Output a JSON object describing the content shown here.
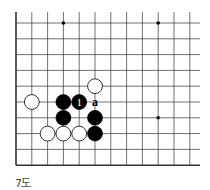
{
  "diagram": {
    "type": "go-board-fragment",
    "caption": "7도",
    "grid": {
      "origin_x": 16,
      "origin_y": 23,
      "spacing": 15.8,
      "cols": 12,
      "rows": 10,
      "left_edge": true,
      "bottom_edge": true
    },
    "star_points": [
      {
        "col": 3,
        "row": 0
      },
      {
        "col": 9,
        "row": 0
      },
      {
        "col": 9,
        "row": 6
      }
    ],
    "stones": [
      {
        "color": "white",
        "col": 5,
        "row": 4
      },
      {
        "color": "white",
        "col": 1,
        "row": 5
      },
      {
        "color": "black",
        "col": 3,
        "row": 5
      },
      {
        "color": "black",
        "col": 4,
        "row": 5,
        "label": "1"
      },
      {
        "color": "black",
        "col": 3,
        "row": 6
      },
      {
        "color": "black",
        "col": 5,
        "row": 6
      },
      {
        "color": "white",
        "col": 2,
        "row": 7
      },
      {
        "color": "white",
        "col": 3,
        "row": 7
      },
      {
        "color": "white",
        "col": 4,
        "row": 7
      },
      {
        "color": "black",
        "col": 5,
        "row": 7
      }
    ],
    "markers": [
      {
        "col": 5,
        "row": 5,
        "label": "a"
      }
    ],
    "colors": {
      "line": "#333333",
      "black_stone": "#000000",
      "white_stone": "#ffffff"
    }
  }
}
